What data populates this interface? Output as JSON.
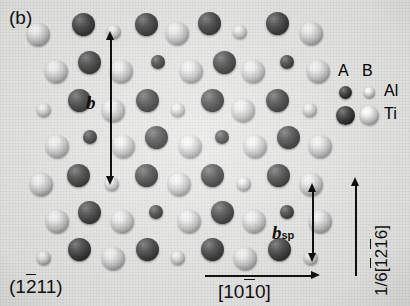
{
  "figure": {
    "panel_label": "(b)",
    "plane_label": "(1211)",
    "plane_parts": {
      "pre": "(1",
      "bar": "2",
      "post": "11)"
    }
  },
  "vectors": {
    "burgers": {
      "symbol": "b",
      "subscript": ""
    },
    "super_partial": {
      "symbol": "b",
      "subscript": "sp"
    },
    "horizontal_direction": {
      "pre": "[10",
      "bar": "1",
      "post": "0]"
    },
    "scale_vector": {
      "pre": "1/6[",
      "bar1": "1",
      "mid": "2",
      "bar2": "1",
      "post": "6]"
    }
  },
  "legend": {
    "column_headers": [
      "A",
      "B"
    ],
    "rows": [
      {
        "label": "Al",
        "a_size": "small",
        "b_size": "small"
      },
      {
        "label": "Ti",
        "a_size": "large",
        "b_size": "large"
      }
    ]
  },
  "colors": {
    "site_a": "#262626",
    "site_b": "#f2f2f2",
    "background": "#e9e9e7",
    "ink": "#111111"
  },
  "atoms": [
    {
      "x": 38,
      "y": 34,
      "site": "b",
      "el": "ti"
    },
    {
      "x": 83,
      "y": 24,
      "site": "a",
      "el": "ti"
    },
    {
      "x": 114,
      "y": 32,
      "site": "b",
      "el": "al"
    },
    {
      "x": 146,
      "y": 24,
      "site": "a",
      "el": "ti"
    },
    {
      "x": 177,
      "y": 33,
      "site": "b",
      "el": "ti"
    },
    {
      "x": 209,
      "y": 23,
      "site": "a",
      "el": "ti"
    },
    {
      "x": 240,
      "y": 32,
      "site": "b",
      "el": "al"
    },
    {
      "x": 277,
      "y": 23,
      "site": "a",
      "el": "ti"
    },
    {
      "x": 311,
      "y": 33,
      "site": "b",
      "el": "ti"
    },
    {
      "x": 56,
      "y": 71,
      "site": "b",
      "el": "ti"
    },
    {
      "x": 89,
      "y": 62,
      "site": "a",
      "el": "ti"
    },
    {
      "x": 121,
      "y": 71,
      "site": "b",
      "el": "ti"
    },
    {
      "x": 158,
      "y": 62,
      "site": "a",
      "el": "al"
    },
    {
      "x": 191,
      "y": 71,
      "site": "b",
      "el": "ti"
    },
    {
      "x": 224,
      "y": 62,
      "site": "a",
      "el": "ti"
    },
    {
      "x": 253,
      "y": 71,
      "site": "b",
      "el": "ti"
    },
    {
      "x": 287,
      "y": 62,
      "site": "a",
      "el": "al"
    },
    {
      "x": 318,
      "y": 71,
      "site": "b",
      "el": "ti"
    },
    {
      "x": 44,
      "y": 110,
      "site": "b",
      "el": "al"
    },
    {
      "x": 79,
      "y": 100,
      "site": "a",
      "el": "ti"
    },
    {
      "x": 113,
      "y": 110,
      "site": "b",
      "el": "ti"
    },
    {
      "x": 147,
      "y": 100,
      "site": "a",
      "el": "ti"
    },
    {
      "x": 178,
      "y": 110,
      "site": "b",
      "el": "al"
    },
    {
      "x": 212,
      "y": 100,
      "site": "a",
      "el": "ti"
    },
    {
      "x": 243,
      "y": 110,
      "site": "b",
      "el": "ti"
    },
    {
      "x": 277,
      "y": 100,
      "site": "a",
      "el": "ti"
    },
    {
      "x": 310,
      "y": 110,
      "site": "b",
      "el": "al"
    },
    {
      "x": 57,
      "y": 146,
      "site": "b",
      "el": "ti"
    },
    {
      "x": 90,
      "y": 137,
      "site": "a",
      "el": "al"
    },
    {
      "x": 123,
      "y": 146,
      "site": "b",
      "el": "ti"
    },
    {
      "x": 156,
      "y": 137,
      "site": "a",
      "el": "ti"
    },
    {
      "x": 190,
      "y": 146,
      "site": "b",
      "el": "ti"
    },
    {
      "x": 222,
      "y": 137,
      "site": "a",
      "el": "al"
    },
    {
      "x": 255,
      "y": 146,
      "site": "b",
      "el": "ti"
    },
    {
      "x": 288,
      "y": 137,
      "site": "a",
      "el": "ti"
    },
    {
      "x": 320,
      "y": 146,
      "site": "b",
      "el": "ti"
    },
    {
      "x": 41,
      "y": 184,
      "site": "b",
      "el": "ti"
    },
    {
      "x": 78,
      "y": 175,
      "site": "a",
      "el": "ti"
    },
    {
      "x": 112,
      "y": 184,
      "site": "b",
      "el": "al"
    },
    {
      "x": 146,
      "y": 175,
      "site": "a",
      "el": "ti"
    },
    {
      "x": 179,
      "y": 184,
      "site": "b",
      "el": "ti"
    },
    {
      "x": 212,
      "y": 175,
      "site": "a",
      "el": "ti"
    },
    {
      "x": 244,
      "y": 184,
      "site": "b",
      "el": "al"
    },
    {
      "x": 278,
      "y": 175,
      "site": "a",
      "el": "ti"
    },
    {
      "x": 311,
      "y": 184,
      "site": "b",
      "el": "ti"
    },
    {
      "x": 57,
      "y": 221,
      "site": "b",
      "el": "ti"
    },
    {
      "x": 89,
      "y": 212,
      "site": "a",
      "el": "ti"
    },
    {
      "x": 122,
      "y": 221,
      "site": "b",
      "el": "ti"
    },
    {
      "x": 156,
      "y": 212,
      "site": "a",
      "el": "al"
    },
    {
      "x": 189,
      "y": 221,
      "site": "b",
      "el": "ti"
    },
    {
      "x": 222,
      "y": 212,
      "site": "a",
      "el": "ti"
    },
    {
      "x": 254,
      "y": 221,
      "site": "b",
      "el": "ti"
    },
    {
      "x": 287,
      "y": 212,
      "site": "a",
      "el": "al"
    },
    {
      "x": 320,
      "y": 221,
      "site": "b",
      "el": "ti"
    },
    {
      "x": 44,
      "y": 258,
      "site": "b",
      "el": "al"
    },
    {
      "x": 79,
      "y": 249,
      "site": "a",
      "el": "ti"
    },
    {
      "x": 113,
      "y": 258,
      "site": "b",
      "el": "ti"
    },
    {
      "x": 147,
      "y": 249,
      "site": "a",
      "el": "ti"
    },
    {
      "x": 178,
      "y": 258,
      "site": "b",
      "el": "al"
    },
    {
      "x": 212,
      "y": 249,
      "site": "a",
      "el": "ti"
    },
    {
      "x": 245,
      "y": 258,
      "site": "b",
      "el": "ti"
    },
    {
      "x": 279,
      "y": 249,
      "site": "a",
      "el": "ti"
    },
    {
      "x": 311,
      "y": 258,
      "site": "b",
      "el": "al"
    }
  ]
}
